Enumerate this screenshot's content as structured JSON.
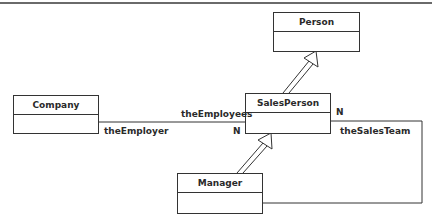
{
  "diagram": {
    "type": "UML class diagram",
    "classes": [
      {
        "id": "person",
        "name": "Person"
      },
      {
        "id": "company",
        "name": "Company"
      },
      {
        "id": "salesperson",
        "name": "SalesPerson"
      },
      {
        "id": "manager",
        "name": "Manager"
      }
    ],
    "relationships": [
      {
        "type": "generalization",
        "from": "SalesPerson",
        "to": "Person"
      },
      {
        "type": "generalization",
        "from": "Manager",
        "to": "SalesPerson"
      },
      {
        "type": "association",
        "from": "Company",
        "to": "SalesPerson",
        "from_role": "theEmployer",
        "to_role": "theEmployees",
        "to_multiplicity": "N"
      },
      {
        "type": "association",
        "from": "Manager",
        "to": "SalesPerson",
        "to_role": "theSalesTeam",
        "to_multiplicity": "N"
      }
    ],
    "labels": {
      "the_employer": "theEmployer",
      "the_employees": "theEmployees",
      "employees_mult": "N",
      "sales_team": "theSalesTeam",
      "sales_team_mult": "N"
    }
  }
}
